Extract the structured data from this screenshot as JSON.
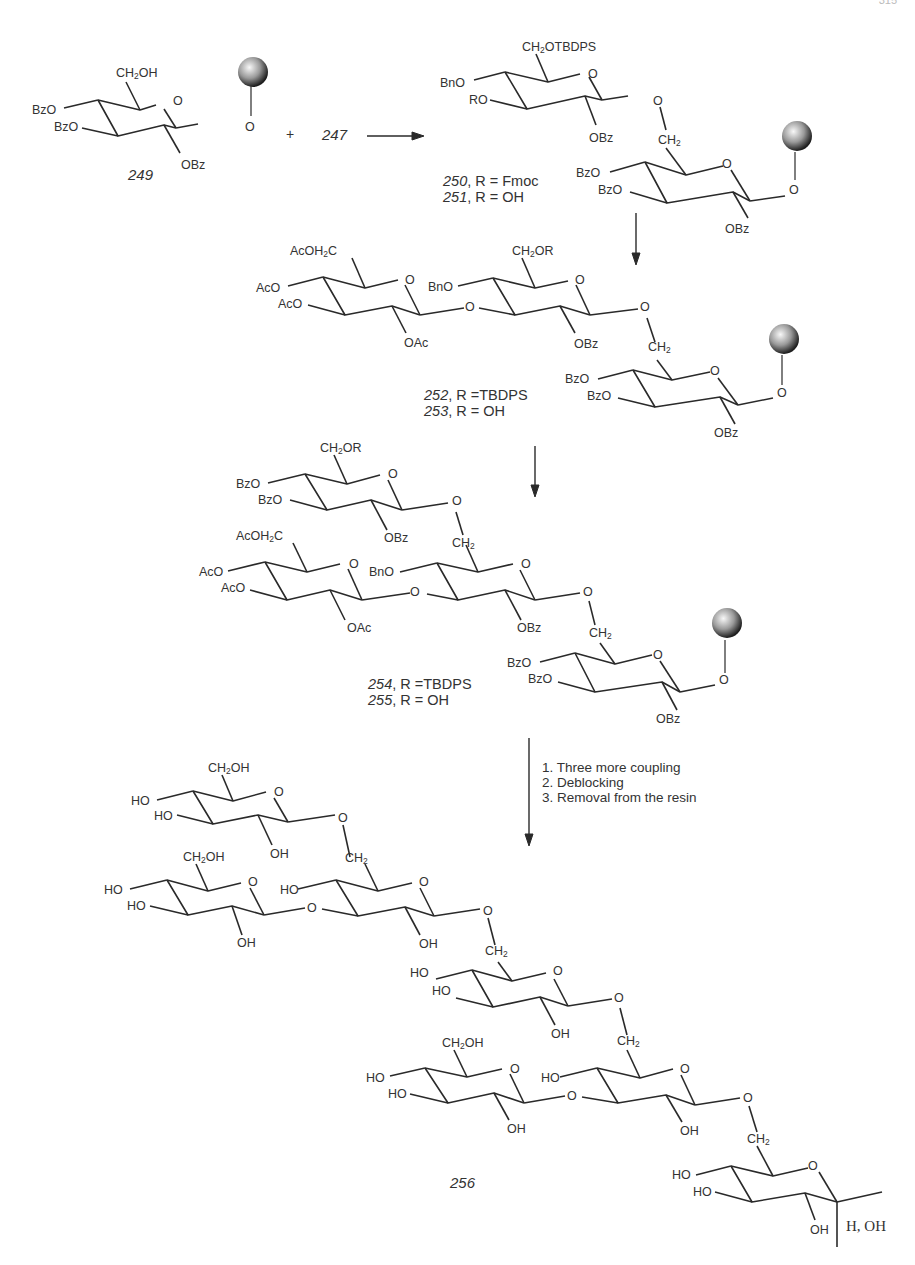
{
  "page": {
    "number": "315"
  },
  "scheme": {
    "reagent_plus": "+",
    "reagent": "247",
    "compounds": {
      "c249": "249",
      "c256": "256"
    },
    "r_definitions": {
      "r250": {
        "num": "250",
        "text": ", R = Fmoc"
      },
      "r251": {
        "num": "251",
        "text": ", R = OH"
      },
      "r252": {
        "num": "252",
        "text": ", R =TBDPS"
      },
      "r253": {
        "num": "253",
        "text": ", R = OH"
      },
      "r254": {
        "num": "254",
        "text": ", R =TBDPS"
      },
      "r255": {
        "num": "255",
        "text": ", R = OH"
      }
    },
    "final_conditions": [
      "1. Three more coupling",
      "2. Deblocking",
      "3. Removal from the resin"
    ],
    "anomeric_label": "H, OH",
    "groups": {
      "bzo": "BzO",
      "obz": "OBz",
      "bno": "BnO",
      "ro": "RO",
      "aco": "AcO",
      "oac": "OAc",
      "ho": "HO",
      "oh": "OH",
      "o": "O",
      "ch2oh_a": "CH",
      "ch2oh_b": "OH",
      "ch2otbdps_b": "OTBDPS",
      "ch2or_b": "OR",
      "ch2_a": "CH",
      "aco_h2c_a": "AcOH",
      "aco_h2c_b": "C",
      "sub2": "2"
    },
    "colors": {
      "ink": "#2a2a2a",
      "bead_dark": "#1e1e1e",
      "bead_light": "#f5f5f5"
    }
  }
}
